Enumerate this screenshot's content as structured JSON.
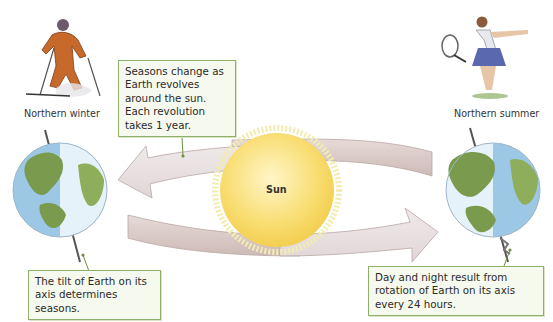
{
  "figure": {
    "sun_label": "Sun",
    "left_earth": {
      "caption": "Northern winter",
      "figure": "skier"
    },
    "right_earth": {
      "caption": "Northern summer",
      "figure": "tennis-player"
    },
    "callouts": {
      "revolution": "Seasons change as Earth revolves around the sun. Each revolution takes 1 year.",
      "tilt": "The tilt of Earth on its axis determines seasons.",
      "rotation": "Day and night result from rotation of Earth on its axis every 24 hours."
    },
    "colors": {
      "sun": "#f8dc6e",
      "ocean": "#9cc8e6",
      "land": "#7a9a4e",
      "orbit_arrow": "#d9c9c6",
      "callout_border": "#8fb068",
      "callout_fill": "#f6f9ee"
    }
  }
}
